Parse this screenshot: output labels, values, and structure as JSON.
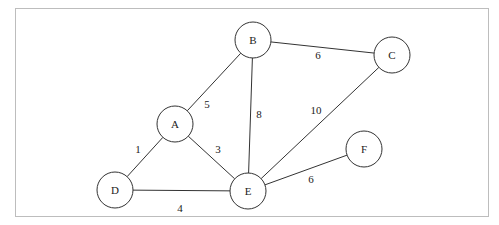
{
  "diagram": {
    "type": "weighted-undirected-graph",
    "nodes": [
      {
        "id": "A",
        "label": "A",
        "x": 175,
        "y": 124
      },
      {
        "id": "B",
        "label": "B",
        "x": 253,
        "y": 40
      },
      {
        "id": "C",
        "label": "C",
        "x": 392,
        "y": 55
      },
      {
        "id": "D",
        "label": "D",
        "x": 115,
        "y": 190
      },
      {
        "id": "E",
        "label": "E",
        "x": 248,
        "y": 191
      },
      {
        "id": "F",
        "label": "F",
        "x": 364,
        "y": 149
      }
    ],
    "edges": [
      {
        "from": "A",
        "to": "B",
        "weight": "5",
        "lx": 207,
        "ly": 108
      },
      {
        "from": "B",
        "to": "C",
        "weight": "6",
        "lx": 318,
        "ly": 59
      },
      {
        "from": "B",
        "to": "E",
        "weight": "8",
        "lx": 259,
        "ly": 118
      },
      {
        "from": "C",
        "to": "E",
        "weight": "10",
        "lx": 316,
        "ly": 114
      },
      {
        "from": "A",
        "to": "D",
        "weight": "1",
        "lx": 138,
        "ly": 153
      },
      {
        "from": "A",
        "to": "E",
        "weight": "3",
        "lx": 218,
        "ly": 153
      },
      {
        "from": "D",
        "to": "E",
        "weight": "4",
        "lx": 180,
        "ly": 212
      },
      {
        "from": "E",
        "to": "F",
        "weight": "6",
        "lx": 311,
        "ly": 183
      }
    ],
    "node_radius": 18,
    "colors": {
      "stroke": "#333333",
      "border": "#bdbdbd",
      "background": "#ffffff"
    }
  }
}
